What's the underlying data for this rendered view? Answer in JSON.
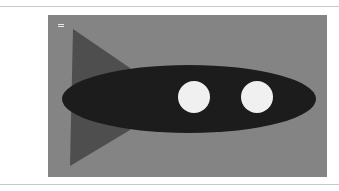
{
  "canvas": {
    "background": "#848484",
    "handle_icon": "drag-handle-icon"
  },
  "drawing": {
    "fin": {
      "color": "#4e4e4e",
      "points": "25,14 82,53 82,115 22,151"
    },
    "body": {
      "color": "#1c1c1c",
      "cx": 141,
      "cy": 84,
      "rx": 127,
      "ry": 34
    },
    "windows": [
      {
        "color": "#f0f0f0",
        "cx": 146,
        "cy": 82,
        "r": 16
      },
      {
        "color": "#f0f0f0",
        "cx": 209,
        "cy": 82,
        "r": 16
      }
    ]
  }
}
